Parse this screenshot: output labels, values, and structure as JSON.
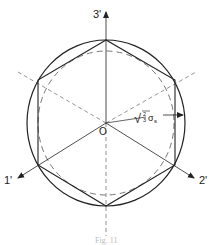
{
  "diagram": {
    "axes": [
      {
        "id": "axis-3",
        "label": "3'"
      },
      {
        "id": "axis-1",
        "label": "1'"
      },
      {
        "id": "axis-2",
        "label": "2'"
      }
    ],
    "origin_label": "O",
    "radius_label": "√(2/3)σs",
    "radius_label_parts": {
      "root": "√",
      "num": "2",
      "den": "3",
      "sigma": "σ",
      "sub": "s"
    },
    "caption": "Fig. 11",
    "colors": {
      "stroke": "#222222",
      "dashed": "#555555",
      "background": "#ffffff"
    },
    "shapes": {
      "outer_circle": "solid",
      "hexagon": "solid, inscribed in circle",
      "inner_curve": "dashed, inscribed",
      "dashed_lines": "three dashed lines through O at 30°, 150°, 270°"
    }
  }
}
